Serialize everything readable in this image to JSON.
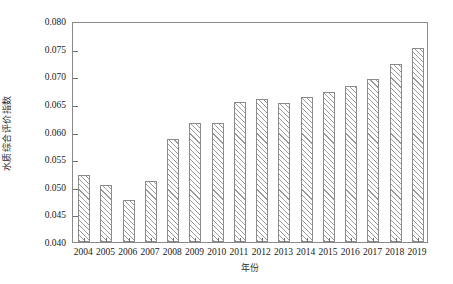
{
  "chart_data": {
    "type": "bar",
    "title": "",
    "subtitle": "",
    "xlabel": "年份",
    "ylabel": "水质综合评价指数",
    "categories": [
      "2004",
      "2005",
      "2006",
      "2007",
      "2008",
      "2009",
      "2010",
      "2011",
      "2012",
      "2013",
      "2014",
      "2015",
      "2016",
      "2017",
      "2018",
      "2019"
    ],
    "values": [
      0.0521,
      0.0504,
      0.0476,
      0.0511,
      0.0587,
      0.0616,
      0.0616,
      0.0653,
      0.0659,
      0.0652,
      0.0662,
      0.0671,
      0.0682,
      0.0695,
      0.0723,
      0.0752
    ],
    "series": [
      {
        "name": "水质综合评价指数",
        "values": [
          0.0521,
          0.0504,
          0.0476,
          0.0511,
          0.0587,
          0.0616,
          0.0616,
          0.0653,
          0.0659,
          0.0652,
          0.0662,
          0.0671,
          0.0682,
          0.0695,
          0.0723,
          0.0752
        ]
      }
    ],
    "ylim": [
      0.04,
      0.08
    ],
    "ytick_values": [
      0.04,
      0.045,
      0.05,
      0.055,
      0.06,
      0.065,
      0.07,
      0.075,
      0.08
    ],
    "ytick_labels": [
      "0.040",
      "0.045",
      "0.050",
      "0.055",
      "0.060",
      "0.065",
      "0.070",
      "0.075",
      "0.080"
    ],
    "grid": false,
    "legend": false,
    "legend_position": "none",
    "bar_fill": "#ffffff",
    "bar_edge_color": "#8b8b8b",
    "bar_hatch": "diagonal-forward",
    "axis_color": "#8a8a8a",
    "background": "#ffffff"
  }
}
